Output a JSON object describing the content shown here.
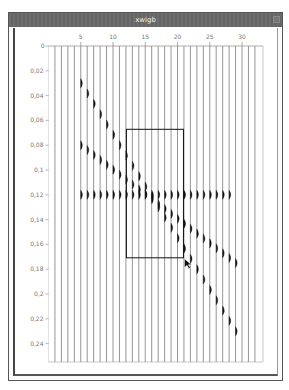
{
  "window": {
    "title": "xwigb"
  },
  "chart_data": {
    "type": "seismic-wiggle",
    "title": "xwigb",
    "xlabel": "",
    "ylabel": "",
    "x_ticks": [
      "5",
      "10",
      "15",
      "20",
      "25",
      "30"
    ],
    "y_ticks": [
      "0",
      "0.02",
      "0.04",
      "0.06",
      "0.08",
      "0.1",
      "0.12",
      "0.14",
      "0.16",
      "0.18",
      "0.2",
      "0.22",
      "0.24"
    ],
    "xlim": [
      1,
      32
    ],
    "ylim": [
      0,
      0.25
    ],
    "num_traces": 32,
    "grid": false,
    "events": [
      {
        "name": "steep-dipping-event",
        "trace_start": 5,
        "time_start": 0.03,
        "trace_end": 29,
        "time_end": 0.23
      },
      {
        "name": "shallow-dipping-event",
        "trace_start": 5,
        "time_start": 0.08,
        "trace_end": 29,
        "time_end": 0.175
      },
      {
        "name": "flat-event",
        "trace_start": 5,
        "time_start": 0.12,
        "trace_end": 28,
        "time_end": 0.12
      }
    ],
    "zoom_box": {
      "trace_min": 12,
      "trace_max": 21,
      "time_min": 0.07,
      "time_max": 0.17
    }
  },
  "cursor": {
    "type": "arrow-pointer"
  }
}
